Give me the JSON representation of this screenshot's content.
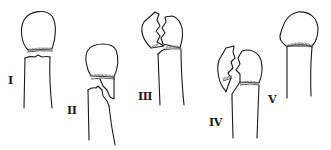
{
  "figure": {
    "line_color": "#1a1a1a",
    "physis_color": "#777777",
    "background": "#ffffff",
    "types": [
      {
        "id": "type-1",
        "label": "I",
        "label_pos": [
          8,
          75
        ]
      },
      {
        "id": "type-2",
        "label": "II",
        "label_pos": [
          67,
          105
        ]
      },
      {
        "id": "type-3",
        "label": "III",
        "label_pos": [
          138,
          91
        ]
      },
      {
        "id": "type-4",
        "label": "IV",
        "label_pos": [
          209,
          117
        ]
      },
      {
        "id": "type-5",
        "label": "V",
        "label_pos": [
          268,
          94
        ]
      }
    ]
  }
}
